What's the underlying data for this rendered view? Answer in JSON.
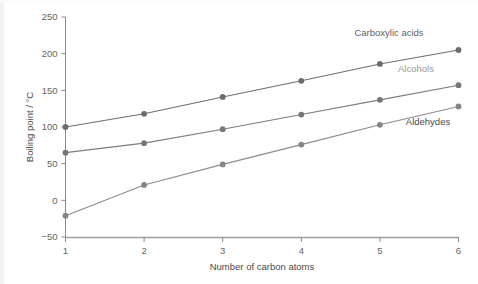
{
  "chart_data": {
    "type": "line",
    "title": "",
    "xlabel": "Number of carbon atoms",
    "ylabel": "Boiling point / °C",
    "x": [
      1,
      2,
      3,
      4,
      5,
      6
    ],
    "categories": [
      "1",
      "2",
      "3",
      "4",
      "5",
      "6"
    ],
    "xlim": [
      1,
      6
    ],
    "ylim": [
      -50,
      250
    ],
    "yticks": [
      -50,
      0,
      50,
      100,
      150,
      200,
      250
    ],
    "ytick_labels": [
      "−50",
      "0",
      "50",
      "100",
      "150",
      "200",
      "250"
    ],
    "xticks": [
      1,
      2,
      3,
      4,
      5,
      6
    ],
    "xtick_labels": [
      "1",
      "2",
      "3",
      "4",
      "5",
      "6"
    ],
    "grid": false,
    "legend_position": "inline-right-of-series",
    "series": [
      {
        "name": "Carboxylic acids",
        "label_color": "#5f5f5f",
        "line_color": "#6e6e6e",
        "marker_color": "#6b6b6b",
        "values": [
          100,
          118,
          141,
          163,
          186,
          205
        ]
      },
      {
        "name": "Alcohols",
        "label_color": "#9a9a9a",
        "line_color": "#7d7d7d",
        "marker_color": "#767676",
        "values": [
          65,
          78,
          97,
          117,
          137,
          157
        ]
      },
      {
        "name": "Aldehydes",
        "label_color": "#4a4a4a",
        "line_color": "#8c8c8c",
        "marker_color": "#858585",
        "values": [
          -21,
          21,
          49,
          76,
          103,
          128
        ]
      }
    ]
  },
  "axes": {
    "y_title": "Boiling point / °C",
    "x_title": "Number of carbon atoms",
    "y_labels": [
      "250",
      "200",
      "150",
      "100",
      "50",
      "0",
      "−50"
    ],
    "x_labels": [
      "1",
      "2",
      "3",
      "4",
      "5",
      "6"
    ]
  },
  "series_labels": {
    "carboxylic": "Carboxylic acids",
    "alcohols": "Alcohols",
    "aldehydes": "Aldehydes"
  },
  "colors": {
    "background": "#ffffff",
    "axis": "#8a8a8a",
    "text": "#646464"
  }
}
